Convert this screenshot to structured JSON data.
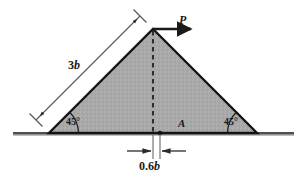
{
  "figure": {
    "type": "statics-free-body-diagram",
    "colors": {
      "body_fill": "#a9a9a9",
      "outline": "#1a1a1a",
      "ground": "#4d4d4d",
      "dimension_line": "#4a4a4a",
      "text": "#1a1a1a",
      "background": "#ffffff"
    },
    "labels": {
      "force": "P",
      "slope_dimension": "3",
      "slope_dimension_unit": "b",
      "angle_left": "45°",
      "angle_right": "45°",
      "point_a": "A",
      "base_offset": "0.6",
      "base_offset_unit": "b"
    },
    "geometry": {
      "apex": {
        "x": 153,
        "y": 29
      },
      "base_left": {
        "x": 49,
        "y": 133
      },
      "base_right": {
        "x": 257,
        "y": 133
      },
      "point_a": {
        "x": 160,
        "y": 133
      },
      "centerline_x": 153,
      "ground_y": 133,
      "base_angle_deg": 45,
      "slope_length_label": "3b",
      "offset_label": "0.6b"
    },
    "annotations": {
      "force_arrow": "horizontal-right-arrow-at-apex",
      "centerline": "vertical-dashed-line-from-apex-to-base",
      "slope_dim_line": "parallel-offset-dimension-line-with-end-ticks",
      "offset_dim_line": "horizontal-dimension-with-inward-arrows"
    }
  }
}
